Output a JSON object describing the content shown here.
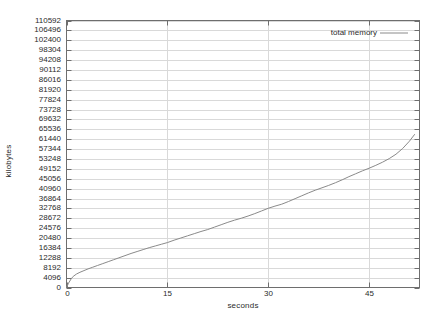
{
  "chart_data": {
    "type": "line",
    "title": "",
    "xlabel": "seconds",
    "ylabel": "kilobytes",
    "xlim": [
      0,
      52.5
    ],
    "ylim": [
      0,
      110592
    ],
    "grid": true,
    "legend_position": "top-right",
    "xticks": [
      0,
      15,
      30,
      45
    ],
    "yticks": [
      0,
      4096,
      8192,
      12288,
      16384,
      20480,
      24576,
      28672,
      32768,
      36864,
      40960,
      45056,
      49152,
      53248,
      57344,
      61440,
      65536,
      69632,
      73728,
      77824,
      81920,
      86016,
      90112,
      94208,
      98304,
      102400,
      106496,
      110592
    ],
    "series": [
      {
        "name": "total memory",
        "color": "#8a8a8a",
        "x": [
          0.0,
          0.3,
          0.7,
          1.0,
          1.5,
          2.0,
          2.6,
          3.2,
          3.9,
          4.6,
          5.4,
          6.2,
          7.0,
          7.8,
          8.7,
          9.6,
          10.5,
          11.4,
          12.3,
          13.2,
          14.1,
          15.0,
          16.0,
          17.0,
          18.0,
          19.0,
          20.0,
          21.0,
          22.0,
          23.0,
          24.0,
          25.0,
          26.0,
          27.0,
          28.0,
          29.0,
          30.0,
          31.0,
          32.0,
          33.0,
          34.0,
          35.0,
          36.0,
          37.0,
          38.0,
          39.0,
          40.0,
          41.0,
          42.0,
          43.0,
          44.0,
          45.0,
          46.0,
          47.0,
          48.0,
          49.0,
          50.0,
          51.0,
          51.8
        ],
        "y": [
          0,
          1800,
          3600,
          4600,
          5600,
          6300,
          7000,
          7700,
          8400,
          9100,
          9900,
          10700,
          11500,
          12300,
          13200,
          14100,
          14900,
          15700,
          16500,
          17200,
          17900,
          18600,
          19600,
          20500,
          21400,
          22300,
          23200,
          24000,
          25000,
          26000,
          27000,
          27900,
          28700,
          29600,
          30600,
          31700,
          32800,
          33700,
          34500,
          35600,
          36800,
          38000,
          39200,
          40300,
          41300,
          42300,
          43400,
          44600,
          45900,
          47100,
          48300,
          49400,
          50600,
          51900,
          53400,
          55200,
          57600,
          60600,
          63500
        ]
      }
    ]
  },
  "axes": {
    "y_axis_title": "kilobytes",
    "x_axis_title": "seconds"
  },
  "legend": {
    "entries": [
      {
        "label": "total memory"
      }
    ]
  },
  "colors": {
    "border": "#6e6e6e",
    "gridline": "#d9d9d9",
    "series_line": "#8a8a8a",
    "text": "#2b2b2b",
    "background": "#ffffff"
  }
}
